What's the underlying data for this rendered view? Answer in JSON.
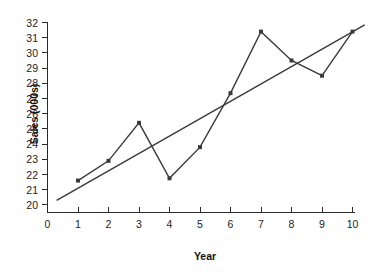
{
  "chart_data": {
    "type": "line",
    "title": "",
    "xlabel": "Year",
    "ylabel": "Sales (000s)",
    "xlim": [
      0,
      10
    ],
    "ylim": [
      20,
      32
    ],
    "grid": false,
    "legend": false,
    "x": [
      1,
      2,
      3,
      4,
      5,
      6,
      7,
      8,
      9,
      10
    ],
    "xticks": [
      "0",
      "1",
      "2",
      "3",
      "4",
      "5",
      "6",
      "7",
      "8",
      "9",
      "10"
    ],
    "yticks": [
      "20",
      "21",
      "22",
      "23",
      "24",
      "25",
      "26",
      "27",
      "28",
      "29",
      "30",
      "31",
      "32"
    ],
    "series": [
      {
        "name": "Sales",
        "type": "line",
        "marker": "square",
        "values": [
          21.6,
          22.9,
          25.4,
          21.75,
          23.8,
          27.35,
          31.4,
          29.5,
          28.5,
          31.4
        ]
      },
      {
        "name": "Trend line",
        "type": "line",
        "marker": "none",
        "x_endpoints": [
          0.3,
          10.4
        ],
        "y_endpoints": [
          20.3,
          31.85
        ]
      }
    ]
  },
  "axes": {
    "x_title": "Year",
    "y_title": "Sales (000s)"
  }
}
